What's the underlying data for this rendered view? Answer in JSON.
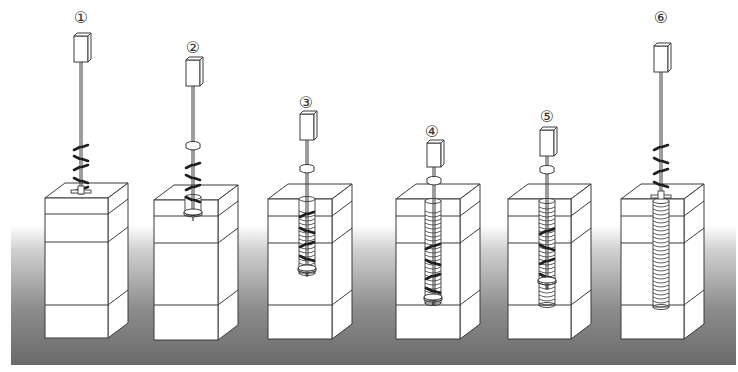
{
  "diagram": {
    "title": "",
    "type": "process-steps",
    "colors": {
      "background": "#ffffff",
      "ground_dark": "#6e6e6e",
      "ground_light": "#ffffff",
      "line": "#3a3a3a",
      "blade": "#1e1e1e",
      "block_fill": "#ffffff"
    },
    "ground_band": {
      "x": 11,
      "y": 225,
      "width": 725,
      "height": 140
    },
    "steps": [
      {
        "label": "①",
        "label_pos": [
          81,
          16
        ],
        "motor": {
          "x": 74,
          "y": 36,
          "w": 14,
          "h": 26
        },
        "rod_bottom": 195,
        "block": {
          "x": 45,
          "y": 198,
          "w": 63,
          "h": 140
        },
        "layers": [
          214,
          242,
          305
        ],
        "bore": null,
        "blades": [
          [
            81,
            148
          ],
          [
            81,
            158
          ],
          [
            81,
            168
          ],
          [
            81,
            180
          ],
          [
            81,
            190
          ]
        ],
        "collar_y": null,
        "tip": {
          "x": 81,
          "y": 190,
          "type": "cross"
        }
      },
      {
        "label": "②",
        "label_pos": [
          193,
          46
        ],
        "motor": {
          "x": 186,
          "y": 60,
          "w": 14,
          "h": 26
        },
        "rod_bottom": 216,
        "block": {
          "x": 154,
          "y": 200,
          "w": 64,
          "h": 140
        },
        "layers": [
          216,
          243,
          305
        ],
        "bore": {
          "cx": 193,
          "top": 197,
          "bottom": 213,
          "rx": 8,
          "coils": false
        },
        "blades": [
          [
            193,
            166
          ],
          [
            193,
            177
          ],
          [
            193,
            188
          ],
          [
            193,
            199
          ]
        ],
        "collar_y": 144,
        "tip": {
          "x": 193,
          "y": 212,
          "type": "ring"
        }
      },
      {
        "label": "③",
        "label_pos": [
          306,
          101
        ],
        "motor": {
          "x": 300,
          "y": 114,
          "w": 14,
          "h": 26
        },
        "rod_bottom": 276,
        "block": {
          "x": 268,
          "y": 199,
          "w": 64,
          "h": 140
        },
        "layers": [
          216,
          243,
          305
        ],
        "bore": {
          "cx": 307,
          "top": 199,
          "bottom": 273,
          "rx": 8,
          "coils": true,
          "coil_top": 211,
          "coil_bottom": 265
        },
        "blades": [
          [
            307,
            215
          ],
          [
            307,
            230
          ],
          [
            307,
            245
          ],
          [
            307,
            258
          ]
        ],
        "collar_y": 167,
        "tip": {
          "x": 307,
          "y": 268,
          "type": "ring"
        }
      },
      {
        "label": "④",
        "label_pos": [
          432,
          130
        ],
        "motor": {
          "x": 427,
          "y": 143,
          "w": 14,
          "h": 24
        },
        "rod_bottom": 306,
        "block": {
          "x": 396,
          "y": 199,
          "w": 64,
          "h": 140
        },
        "layers": [
          216,
          243,
          305
        ],
        "bore": {
          "cx": 433,
          "top": 201,
          "bottom": 303,
          "rx": 8,
          "coils": true,
          "coil_top": 211,
          "coil_bottom": 298
        },
        "blades": [
          [
            433,
            247
          ],
          [
            433,
            262
          ],
          [
            433,
            277
          ],
          [
            433,
            290
          ]
        ],
        "collar_y": 179,
        "tip": {
          "x": 433,
          "y": 297,
          "type": "ring"
        }
      },
      {
        "label": "⑤",
        "label_pos": [
          547,
          115
        ],
        "motor": {
          "x": 540,
          "y": 130,
          "w": 14,
          "h": 26
        },
        "rod_bottom": 290,
        "block": {
          "x": 508,
          "y": 199,
          "w": 63,
          "h": 140
        },
        "layers": [
          216,
          243,
          305
        ],
        "bore": {
          "cx": 547,
          "top": 201,
          "bottom": 305,
          "rx": 8,
          "coils": true,
          "coil_top": 207,
          "coil_bottom": 303
        },
        "blades": [
          [
            547,
            232
          ],
          [
            547,
            247
          ],
          [
            547,
            262
          ],
          [
            547,
            276
          ]
        ],
        "collar_y": 168,
        "tip": {
          "x": 547,
          "y": 280,
          "type": "ring"
        }
      },
      {
        "label": "⑥",
        "label_pos": [
          661,
          16
        ],
        "motor": {
          "x": 654,
          "y": 46,
          "w": 14,
          "h": 26
        },
        "rod_bottom": 198,
        "block": {
          "x": 621,
          "y": 199,
          "w": 63,
          "h": 140
        },
        "layers": [
          216,
          243,
          305
        ],
        "bore": {
          "cx": 661,
          "top": 201,
          "bottom": 307,
          "rx": 8,
          "coils": true,
          "coil_top": 205,
          "coil_bottom": 305
        },
        "blades": [
          [
            661,
            148
          ],
          [
            661,
            160
          ],
          [
            661,
            172
          ],
          [
            661,
            184
          ]
        ],
        "collar_y": null,
        "tip": {
          "x": 661,
          "y": 195,
          "type": "cross"
        }
      }
    ],
    "block_depth": {
      "dx": 20,
      "dy": 15
    }
  }
}
